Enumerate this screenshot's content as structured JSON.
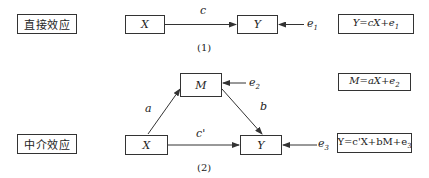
{
  "diagram": {
    "panel1": {
      "label": "直接效应",
      "nodes": {
        "x": "X",
        "y": "Y"
      },
      "path_label": "c",
      "error_label": "e",
      "error_sub": "1",
      "equation": {
        "lhs": "Y=cX+e",
        "sub": "1"
      },
      "caption": "(1)"
    },
    "panel2": {
      "label": "中介效应",
      "nodes": {
        "x": "X",
        "m": "M",
        "y": "Y"
      },
      "path_a": "a",
      "path_b": "b",
      "path_c_prime": "c'",
      "error_m_label": "e",
      "error_m_sub": "2",
      "error_y_label": "e",
      "error_y_sub": "3",
      "equation_m": {
        "lhs": "M=aX+e",
        "sub": "2"
      },
      "equation_y": {
        "lhs": "Y=c'X+bM+e",
        "sub": "3"
      },
      "caption": "(2)"
    }
  }
}
